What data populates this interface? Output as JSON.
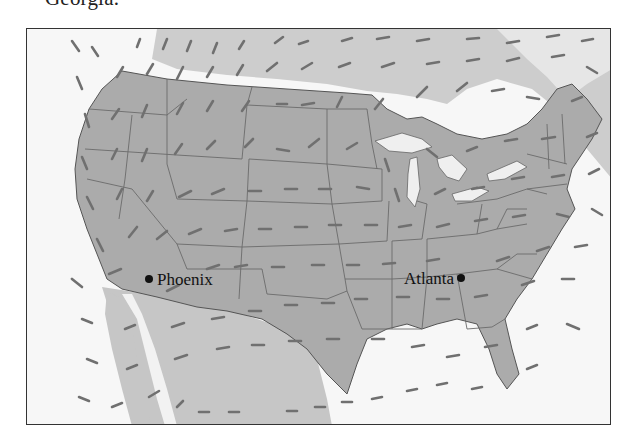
{
  "caption": {
    "text": "Georgia."
  },
  "map": {
    "title": "Wind velocity vector field over the continental United States",
    "colors": {
      "us_land": "#a9a9a9",
      "canada_mexico_land": "#cfcfcf",
      "water": "#f6f6f6",
      "state_lines": "#6b6b6b",
      "arrows": "#6e6e6e",
      "frame": "#333333",
      "city_dot": "#111111"
    },
    "cities": [
      {
        "name": "Phoenix",
        "label": "Phoenix",
        "dot": [
          122,
          250
        ],
        "label_pos": [
          130,
          256
        ],
        "anchor": "start"
      },
      {
        "name": "Atlanta",
        "label": "Atlanta",
        "dot": [
          434,
          249
        ],
        "label_pos": [
          426,
          255
        ],
        "anchor": "end"
      }
    ]
  }
}
